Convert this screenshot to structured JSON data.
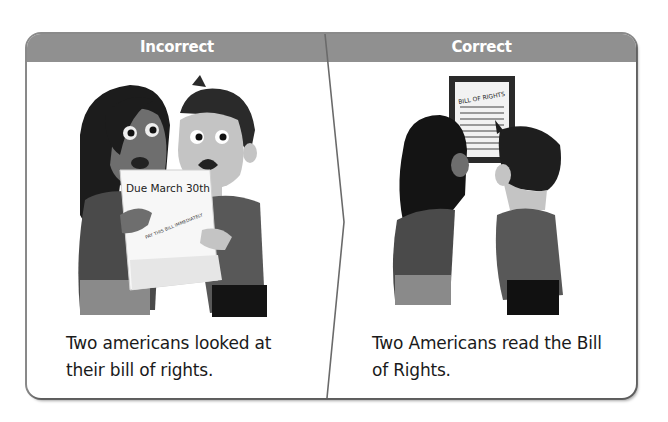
{
  "panels": {
    "incorrect": {
      "header": "Incorrect",
      "caption_line1": "Two americans looked at",
      "caption_line2": "their bill of rights.",
      "illustration": {
        "description": "Two worried people looking at a bill",
        "paper_heading": "Due March 30th",
        "paper_stamp": "PAY THIS BILL IMMEDIATELY"
      }
    },
    "correct": {
      "header": "Correct",
      "caption_line1": "Two Americans read the Bill",
      "caption_line2": "of Rights.",
      "illustration": {
        "description": "Two people viewed from behind reading a framed document",
        "document_title": "BILL OF RIGHTS"
      }
    }
  },
  "colors": {
    "header_bg": "#909090",
    "header_text": "#ffffff",
    "frame_border": "#8a8a8a",
    "caption_text": "#1a1a1a"
  }
}
